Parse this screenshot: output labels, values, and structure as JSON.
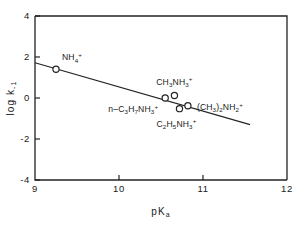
{
  "chart_data": {
    "type": "scatter",
    "title": "",
    "xlabel": "pKa",
    "xlabel_parts": {
      "main": "pK",
      "sub": "a"
    },
    "ylabel": "log k-1",
    "ylabel_parts": {
      "main": "log k",
      "sub": "-1"
    },
    "xlim": [
      9,
      12
    ],
    "ylim": [
      -4,
      4
    ],
    "xticks": [
      "9",
      "10",
      "11",
      "12"
    ],
    "xtick_values": [
      9,
      10,
      11,
      12
    ],
    "yticks": [
      "4",
      "2",
      "0",
      "-2",
      "-4"
    ],
    "ytick_values": [
      4,
      2,
      0,
      -2,
      -4
    ],
    "grid": false,
    "legend": "none",
    "marker_style": "open-circle",
    "points": [
      {
        "label": "NH4+",
        "label_parts": {
          "pre": "NH",
          "sub": "4",
          "sup": "+"
        },
        "x": 9.25,
        "y": 1.4,
        "label_dx": 6,
        "label_dy": -9,
        "label_anchor": "start"
      },
      {
        "label": "n-C3H7NH3+",
        "label_parts": {
          "pre": "n–C",
          "sub": "3",
          "mid": "H",
          "sub2": "7",
          "mid2": "NH",
          "sub3": "3",
          "sup": "+"
        },
        "x": 10.55,
        "y": 0.0,
        "label_dx": -7,
        "label_dy": 14,
        "label_anchor": "end"
      },
      {
        "label": "CH3NH3+",
        "label_parts": {
          "pre": "CH",
          "sub": "3",
          "mid": "NH",
          "sub2": "3",
          "sup": "+"
        },
        "x": 10.66,
        "y": 0.12,
        "label_dx": 0,
        "label_dy": -11,
        "label_anchor": "middle"
      },
      {
        "label": "C2H5NH3+",
        "label_parts": {
          "pre": "C",
          "sub": "2",
          "mid": "H",
          "sub2": "5",
          "mid2": "NH",
          "sub3": "3",
          "sup": "+"
        },
        "x": 10.72,
        "y": -0.52,
        "label_dx": -3,
        "label_dy": 18,
        "label_anchor": "middle"
      },
      {
        "label": "(CH3)2NH2+",
        "label_parts": {
          "pre": "(CH",
          "sub": "3",
          "mid": ")",
          "sub2": "2",
          "mid2": "NH",
          "sub3": "2",
          "sup": "+"
        },
        "x": 10.82,
        "y": -0.38,
        "label_dx": 9,
        "label_dy": 4,
        "label_anchor": "start"
      }
    ],
    "trend_line": {
      "x_start": 9.0,
      "y_start": 1.72,
      "x_end": 11.56,
      "y_end": -1.3,
      "slope": -1.18,
      "intercept": 12.34
    }
  }
}
